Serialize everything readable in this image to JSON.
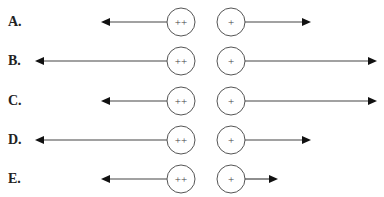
{
  "figure": {
    "left_charge_label": "++",
    "right_charge_label": "+",
    "unit_note": "arrow lengths in relative units (short=2, long=4, shortest=1)"
  },
  "options": [
    {
      "label": "A.",
      "left_arrow_length": 2,
      "right_arrow_length": 2
    },
    {
      "label": "B.",
      "left_arrow_length": 4,
      "right_arrow_length": 4
    },
    {
      "label": "C.",
      "left_arrow_length": 2,
      "right_arrow_length": 4
    },
    {
      "label": "D.",
      "left_arrow_length": 4,
      "right_arrow_length": 2
    },
    {
      "label": "E.",
      "left_arrow_length": 2,
      "right_arrow_length": 1
    }
  ]
}
